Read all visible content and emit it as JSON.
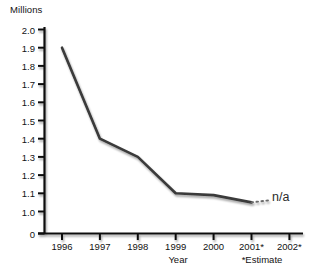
{
  "chart_data": {
    "type": "line",
    "title": "",
    "xlabel": "Year",
    "ylabel": "Millions",
    "categories": [
      "1996",
      "1997",
      "1998",
      "1999",
      "2000",
      "2001*",
      "2002*"
    ],
    "values": [
      1.9,
      1.4,
      1.3,
      1.1,
      1.09,
      1.05,
      null
    ],
    "series": [
      {
        "name": "Millions",
        "values": [
          1.9,
          1.4,
          1.3,
          1.1,
          1.09,
          1.05,
          null
        ]
      }
    ],
    "ylim": [
      0,
      2.0
    ],
    "ytick_labels": [
      "2.0",
      "1.9",
      "1.8",
      "1.7",
      "1.6",
      "1.5",
      "1.4",
      "1.3",
      "1.2",
      "1.1",
      "1.0",
      "0"
    ],
    "ytick_values": [
      2.0,
      1.9,
      1.8,
      1.7,
      1.6,
      1.5,
      1.4,
      1.3,
      1.2,
      1.1,
      1.0,
      0
    ],
    "grid": false,
    "legend": "none",
    "annotations": [
      {
        "text": "n/a",
        "at_category": "2002*",
        "note": "dotted line extends from 2001* to 2002* where value is not available"
      },
      {
        "text": "*Estimate",
        "note": "footnote under x-axis marking 2001* and 2002* as estimates"
      }
    ],
    "line_color": "#3a3a3a",
    "axis_color": "#111111"
  },
  "axis": {
    "y_unit_label": "Millions",
    "x_title": "Year",
    "footnote": "*Estimate"
  },
  "annotation": {
    "na_text": "n/a"
  },
  "cropped_title_remnant": ""
}
